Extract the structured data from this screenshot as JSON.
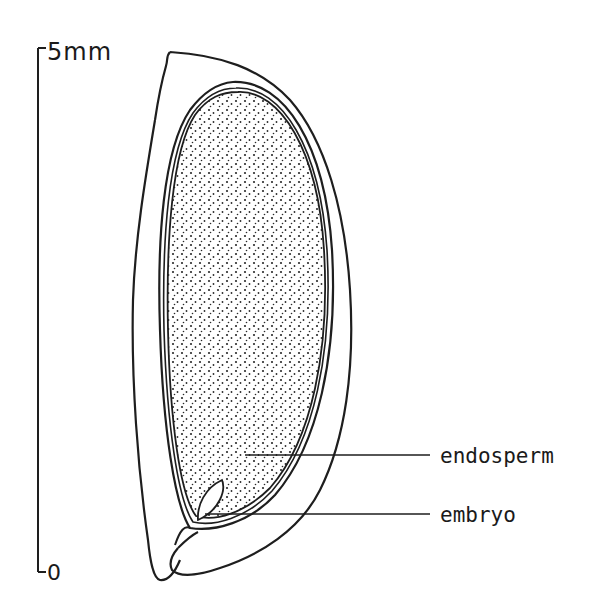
{
  "figure": {
    "stroke_color": "#1e1e1e",
    "background": "#ffffff"
  },
  "scale_bar": {
    "top_label": "5mm",
    "bottom_label": "0",
    "max_value": 5,
    "min_value": 0,
    "unit": "mm"
  },
  "labels": {
    "endosperm": "endosperm",
    "embryo": "embryo"
  }
}
